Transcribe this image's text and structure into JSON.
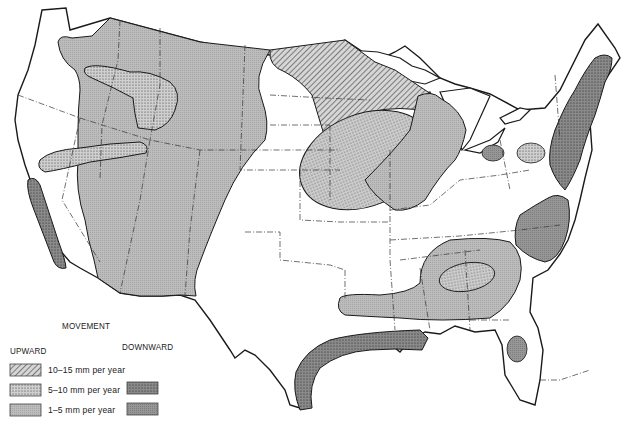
{
  "map": {
    "subject": "Vertical crustal movement, conterminous United States",
    "region": "Conterminous United States"
  },
  "legend": {
    "title": "MOVEMENT",
    "upward_label": "UPWARD",
    "downward_label": "DOWNWARD",
    "rows": [
      {
        "label": "10–15 mm per year",
        "upward_pattern": "hatched",
        "downward_pattern": null
      },
      {
        "label": "5–10 mm per year",
        "upward_pattern": "light-stippled",
        "downward_pattern": "dark-stippled"
      },
      {
        "label": "1–5 mm per year",
        "upward_pattern": "light-solid",
        "downward_pattern": "dark-solid"
      }
    ]
  },
  "colors": {
    "background": "#ffffff",
    "outline": "#1a1a1a",
    "up_1_5": "#b8b8b8",
    "up_5_10": "#c6c6c6",
    "up_10_15": "#bdbdbd",
    "down_1_5": "#8f8f8f",
    "down_5_10": "#858585"
  }
}
